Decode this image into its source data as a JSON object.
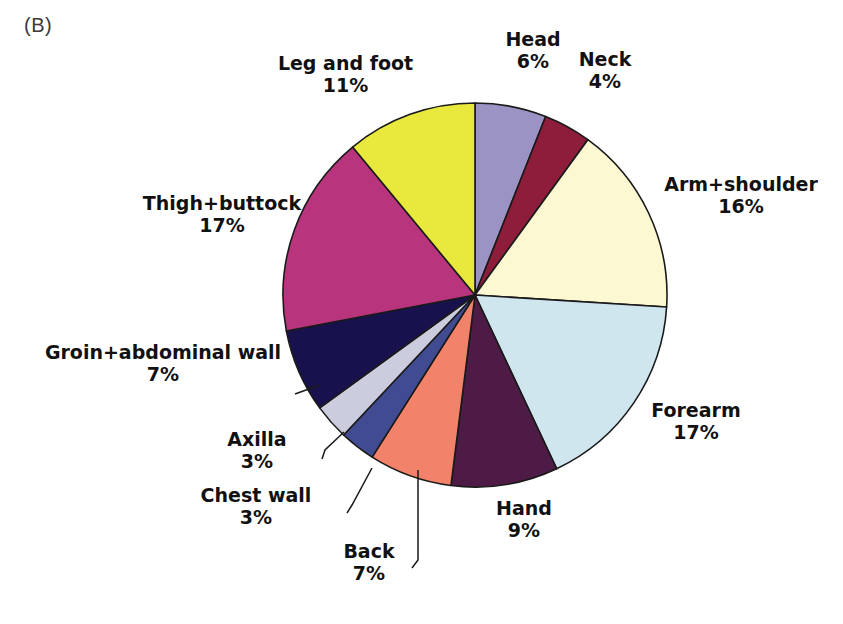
{
  "panel": {
    "label": "(B)"
  },
  "chart_data": {
    "type": "pie",
    "title": "",
    "subtitle": "",
    "xlabel": "",
    "ylabel": "",
    "legend_position": "none",
    "grid": false,
    "units": "percent",
    "total": 100,
    "start_angle_deg": 0,
    "direction": "clockwise",
    "categories": [
      "Head",
      "Neck",
      "Arm+shoulder",
      "Forearm",
      "Hand",
      "Back",
      "Chest wall",
      "Axilla",
      "Groin+abdominal wall",
      "Thigh+buttock",
      "Leg and foot"
    ],
    "values": [
      6,
      4,
      16,
      17,
      9,
      7,
      3,
      3,
      7,
      17,
      11
    ],
    "value_labels": [
      "6%",
      "4%",
      "16%",
      "17%",
      "9%",
      "7%",
      "3%",
      "3%",
      "7%",
      "17%",
      "11%"
    ],
    "colors": [
      "#9b93c4",
      "#8e1d3b",
      "#fbf8d2",
      "#cfe6ef",
      "#4d1b45",
      "#f2836a",
      "#414b92",
      "#ccccdf",
      "#17124d",
      "#b8357e",
      "#e9e83c"
    ],
    "slices": [
      {
        "name": "Head",
        "value": 6,
        "value_label": "6%",
        "color": "#9b93c4"
      },
      {
        "name": "Neck",
        "value": 4,
        "value_label": "4%",
        "color": "#8e1d3b"
      },
      {
        "name": "Arm+shoulder",
        "value": 16,
        "value_label": "16%",
        "color": "#fbf8d2"
      },
      {
        "name": "Forearm",
        "value": 17,
        "value_label": "17%",
        "color": "#cfe6ef"
      },
      {
        "name": "Hand",
        "value": 9,
        "value_label": "9%",
        "color": "#4d1b45"
      },
      {
        "name": "Back",
        "value": 7,
        "value_label": "7%",
        "color": "#f2836a"
      },
      {
        "name": "Chest wall",
        "value": 3,
        "value_label": "3%",
        "color": "#414b92"
      },
      {
        "name": "Axilla",
        "value": 3,
        "value_label": "3%",
        "color": "#ccccdf"
      },
      {
        "name": "Groin+abdominal wall",
        "value": 7,
        "value_label": "7%",
        "color": "#17124d"
      },
      {
        "name": "Thigh+buttock",
        "value": 17,
        "value_label": "17%",
        "color": "#b8357e"
      },
      {
        "name": "Leg and foot",
        "value": 11,
        "value_label": "11%",
        "color": "#e9e83c"
      }
    ]
  },
  "labels": {
    "head": {
      "name": "Head",
      "pct": "6%"
    },
    "neck": {
      "name": "Neck",
      "pct": "4%"
    },
    "arm": {
      "name": "Arm+shoulder",
      "pct": "16%"
    },
    "forearm": {
      "name": "Forearm",
      "pct": "17%"
    },
    "hand": {
      "name": "Hand",
      "pct": "9%"
    },
    "back": {
      "name": "Back",
      "pct": "7%"
    },
    "chest_wall": {
      "name": "Chest wall",
      "pct": "3%"
    },
    "axilla": {
      "name": "Axilla",
      "pct": "3%"
    },
    "groin": {
      "name": "Groin+abdominal wall",
      "pct": "7%"
    },
    "thigh": {
      "name": "Thigh+buttock",
      "pct": "17%"
    },
    "leg_foot": {
      "name": "Leg and foot",
      "pct": "11%"
    }
  },
  "geometry": {
    "center_x": 475,
    "center_y": 295,
    "radius": 192,
    "outline_color": "#1a1a1a"
  }
}
